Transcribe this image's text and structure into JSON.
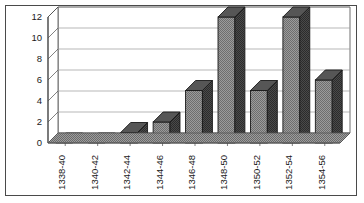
{
  "chart_data": {
    "type": "bar",
    "title": "",
    "subtitle": "",
    "xlabel": "",
    "ylabel": "",
    "categories": [
      "1338-40",
      "1340-42",
      "1342-44",
      "1344-46",
      "1346-48",
      "1348-50",
      "1350-52",
      "1352-54",
      "1354-56"
    ],
    "values": [
      0,
      0,
      1,
      2,
      5,
      12,
      5,
      12,
      6
    ],
    "ylim": [
      0,
      12
    ],
    "yticks": [
      0,
      2,
      4,
      6,
      8,
      10,
      12
    ],
    "ytick_labels": [
      "0",
      "2",
      "4",
      "6",
      "8",
      "10",
      "12"
    ],
    "grid": true,
    "grid_axis": "y",
    "legend": false,
    "legend_position": "none",
    "style": "3d-column",
    "annotations": []
  },
  "colors": {
    "bar_face": "#8c8c8c",
    "bar_side": "#3d3d3d",
    "bar_top": "#565656",
    "bar_outline": "#1a1a1a",
    "floor": "#8f8f8f",
    "floor_edge": "#555555",
    "back_wall": "#ffffff",
    "gridline": "#9a9a9a",
    "axis": "#4a4a4a",
    "frame": "#4a4a4a",
    "text": "#1a1a1a",
    "background": "#ffffff"
  }
}
